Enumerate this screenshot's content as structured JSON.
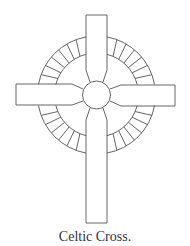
{
  "figure": {
    "title": "Celtic Cross.",
    "ring_segments_per_quadrant": 7,
    "stroke_color": "#555555",
    "background_color": "#ffffff"
  },
  "caption": "Celtic Cross."
}
